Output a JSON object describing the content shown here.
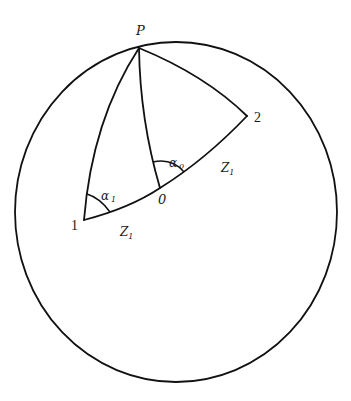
{
  "diagram": {
    "type": "spherical-geometry",
    "colors": {
      "stroke": "#111111",
      "background": "#ffffff"
    },
    "points": {
      "P": {
        "label": "P"
      },
      "one": {
        "label": "1"
      },
      "two": {
        "label": "2"
      },
      "O": {
        "label": "0"
      }
    },
    "angles": {
      "alpha1": {
        "label": "α",
        "sub": "1"
      },
      "alpha0": {
        "label": "α",
        "sub": "0"
      }
    },
    "segments": {
      "z_right": {
        "label": "Z",
        "sub": "1"
      },
      "z_left": {
        "label": "Z",
        "sub": "1"
      }
    }
  }
}
